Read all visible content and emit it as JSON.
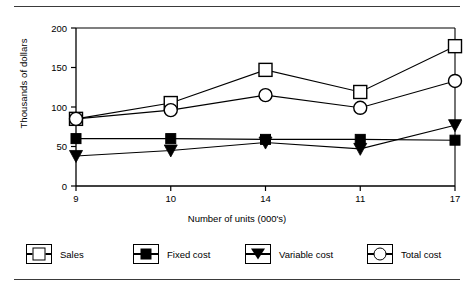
{
  "chart_data": {
    "type": "line",
    "title": "",
    "xlabel": "Number of units (000's)",
    "ylabel": "Thousands of dollars",
    "categories": [
      "9",
      "10",
      "14",
      "11",
      "17"
    ],
    "xtick_labels": [
      "9",
      "10",
      "14",
      "11",
      "17"
    ],
    "ytick_labels": [
      "0",
      "50",
      "100",
      "150",
      "200"
    ],
    "yticks": [
      0,
      50,
      100,
      150,
      200
    ],
    "ylim": [
      0,
      200
    ],
    "grid": false,
    "legend_position": "bottom",
    "series": [
      {
        "name": "Sales",
        "marker": "square-open",
        "values": [
          85,
          105,
          147,
          119,
          177
        ]
      },
      {
        "name": "Fixed cost",
        "marker": "square-filled",
        "values": [
          60,
          60,
          59,
          59,
          58
        ]
      },
      {
        "name": "Variable cost",
        "marker": "triangle-down-filled",
        "values": [
          38,
          45,
          55,
          47,
          77
        ]
      },
      {
        "name": "Total cost",
        "marker": "circle-open",
        "values": [
          85,
          96,
          115,
          99,
          133
        ]
      }
    ]
  },
  "legend": {
    "items": [
      {
        "label": "Sales",
        "glyph": "square-open-icon"
      },
      {
        "label": "Fixed cost",
        "glyph": "square-filled-icon"
      },
      {
        "label": "Variable cost",
        "glyph": "triangle-down-filled-icon"
      },
      {
        "label": "Total cost",
        "glyph": "circle-open-icon"
      }
    ]
  },
  "axes": {
    "y_title": "Thousands of dollars",
    "x_title": "Number of units (000's)"
  },
  "colors": {
    "ink": "#000000",
    "rule": "#3a3a3a",
    "background": "#ffffff"
  }
}
